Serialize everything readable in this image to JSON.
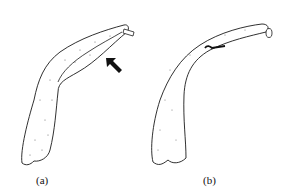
{
  "figure": {
    "panels": [
      {
        "id": "a",
        "label": "(a)",
        "annotation": "arrow-pointing-to-fold"
      },
      {
        "id": "b",
        "label": "(b)",
        "annotation": "dark-mark-on-upper-edge"
      }
    ],
    "colors": {
      "stroke": "#1a1a1a",
      "fill": "#ffffff",
      "arrow": "#111111",
      "stipple": "#555555"
    }
  }
}
